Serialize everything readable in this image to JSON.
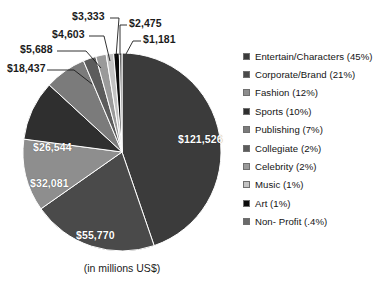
{
  "chart_data": {
    "type": "pie",
    "title": "",
    "subtitle": "",
    "caption": "(in millions US$)",
    "units": "millions US$",
    "total": 271798,
    "legend_position": "right",
    "grid": false,
    "value_prefix": "$",
    "categories": [
      "Entertain/Characters",
      "Corporate/Brand",
      "Fashion",
      "Sports",
      "Publishing",
      "Collegiate",
      "Celebrity",
      "Music",
      "Art",
      "Non- Profit"
    ],
    "slices": [
      {
        "name": "Entertain/Characters",
        "legend_label": "Entertain/Characters (45%)",
        "value": 121526,
        "value_label": "$121,526",
        "percent": 45,
        "percent_label": "45%",
        "color": "#3b3b3b",
        "label_placement": "inside"
      },
      {
        "name": "Corporate/Brand",
        "legend_label": "Corporate/Brand (21%)",
        "value": 55770,
        "value_label": "$55,770",
        "percent": 21,
        "percent_label": "21%",
        "color": "#4a4a4a",
        "label_placement": "inside"
      },
      {
        "name": "Fashion",
        "legend_label": "Fashion (12%)",
        "value": 32081,
        "value_label": "$32,081",
        "percent": 12,
        "percent_label": "12%",
        "color": "#8e8e8e",
        "label_placement": "inside"
      },
      {
        "name": "Sports",
        "legend_label": "Sports (10%)",
        "value": 26544,
        "value_label": "$26,544",
        "percent": 10,
        "percent_label": "10%",
        "color": "#2f2f2f",
        "label_placement": "inside"
      },
      {
        "name": "Publishing",
        "legend_label": "Publishing (7%)",
        "value": 18437,
        "value_label": "$18,437",
        "percent": 7,
        "percent_label": "7%",
        "color": "#7b7b7b",
        "label_placement": "callout"
      },
      {
        "name": "Collegiate",
        "legend_label": "Collegiate (2%)",
        "value": 5688,
        "value_label": "$5,688",
        "percent": 2,
        "percent_label": "2%",
        "color": "#5c5c5c",
        "label_placement": "callout"
      },
      {
        "name": "Celebrity",
        "legend_label": "Celebrity (2%)",
        "value": 4603,
        "value_label": "$4,603",
        "percent": 2,
        "percent_label": "2%",
        "color": "#9a9a9a",
        "label_placement": "callout"
      },
      {
        "name": "Music",
        "legend_label": "Music (1%)",
        "value": 3333,
        "value_label": "$3,333",
        "percent": 1,
        "percent_label": "1%",
        "color": "#c3c3c3",
        "label_placement": "callout"
      },
      {
        "name": "Art",
        "legend_label": "Art (1%)",
        "value": 2475,
        "value_label": "$2,475",
        "percent": 1,
        "percent_label": "1%",
        "color": "#0b0b0b",
        "label_placement": "callout"
      },
      {
        "name": "Non- Profit",
        "legend_label": "Non- Profit (.4%)",
        "value": 1181,
        "value_label": "$1,181",
        "percent": 0.4,
        "percent_label": ".4%",
        "color": "#6a6a6a",
        "label_placement": "callout"
      }
    ]
  },
  "legend": {
    "items": [
      {
        "label": "Entertain/Characters (45%)",
        "color": "#3b3b3b"
      },
      {
        "label": "Corporate/Brand (21%)",
        "color": "#4a4a4a"
      },
      {
        "label": "Fashion (12%)",
        "color": "#8e8e8e"
      },
      {
        "label": "Sports (10%)",
        "color": "#2f2f2f"
      },
      {
        "label": "Publishing (7%)",
        "color": "#7b7b7b"
      },
      {
        "label": "Collegiate (2%)",
        "color": "#5c5c5c"
      },
      {
        "label": "Celebrity (2%)",
        "color": "#9a9a9a"
      },
      {
        "label": "Music (1%)",
        "color": "#c3c3c3"
      },
      {
        "label": "Art (1%)",
        "color": "#0b0b0b"
      },
      {
        "label": "Non- Profit (.4%)",
        "color": "#6a6a6a"
      }
    ]
  },
  "caption": "(in millions US$)"
}
